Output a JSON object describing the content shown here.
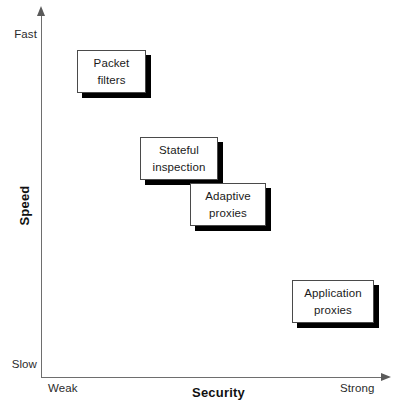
{
  "chart_data": {
    "type": "scatter",
    "title": "",
    "xlabel": "Security",
    "ylabel": "Speed",
    "x_tick_labels": [
      "Weak",
      "Strong"
    ],
    "y_tick_labels": [
      "Slow",
      "Fast"
    ],
    "xlim": [
      "Weak",
      "Strong"
    ],
    "ylim": [
      "Slow",
      "Fast"
    ],
    "grid": false,
    "legend": "none",
    "annotations": [
      {
        "label": "Packet filters",
        "line1": "Packet",
        "line2": "filters",
        "security": "weak",
        "speed": "fast"
      },
      {
        "label": "Stateful inspection",
        "line1": "Stateful",
        "line2": "inspection",
        "security": "medium-low",
        "speed": "medium"
      },
      {
        "label": "Adaptive proxies",
        "line1": "Adaptive",
        "line2": "proxies",
        "security": "medium",
        "speed": "medium-low"
      },
      {
        "label": "Application proxies",
        "line1": "Application",
        "line2": "proxies",
        "security": "strong",
        "speed": "slow"
      }
    ]
  },
  "axes": {
    "y": {
      "title": "Speed",
      "top_label": "Fast",
      "bottom_label": "Slow"
    },
    "x": {
      "title": "Security",
      "left_label": "Weak",
      "right_label": "Strong"
    }
  },
  "nodes": [
    {
      "id": "packet-filters",
      "line1": "Packet",
      "line2": "filters"
    },
    {
      "id": "stateful-inspection",
      "line1": "Stateful",
      "line2": "inspection"
    },
    {
      "id": "adaptive-proxies",
      "line1": "Adaptive",
      "line2": "proxies"
    },
    {
      "id": "application-proxies",
      "line1": "Application",
      "line2": "proxies"
    }
  ],
  "colors": {
    "background": "#ffffff",
    "axis": "#6e6e6e",
    "box_border": "#4a4a4a",
    "box_fill": "#ffffff",
    "box_shadow": "#000000",
    "text": "#1a1a1a"
  }
}
